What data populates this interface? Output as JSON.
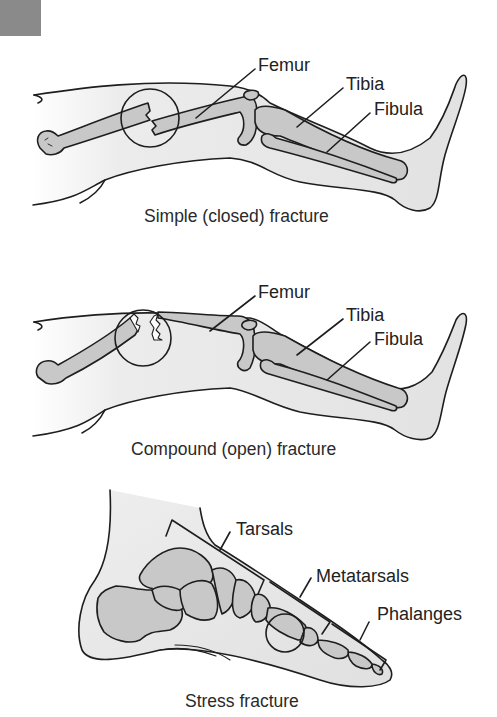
{
  "colors": {
    "corner_block": "#8a8a8a",
    "skin_fill": "#e6e6e6",
    "bone_fill": "#c8c8c8",
    "outline": "#1e1e1e",
    "text": "#222222"
  },
  "panels": [
    {
      "id": "simple",
      "caption": "Simple (closed) fracture",
      "labels": {
        "femur": "Femur",
        "tibia": "Tibia",
        "fibula": "Fibula"
      }
    },
    {
      "id": "compound",
      "caption": "Compound (open) fracture",
      "labels": {
        "femur": "Femur",
        "tibia": "Tibia",
        "fibula": "Fibula"
      }
    },
    {
      "id": "stress",
      "caption": "Stress fracture",
      "labels": {
        "tarsals": "Tarsals",
        "metatarsals": "Metatarsals",
        "phalanges": "Phalanges"
      }
    }
  ]
}
